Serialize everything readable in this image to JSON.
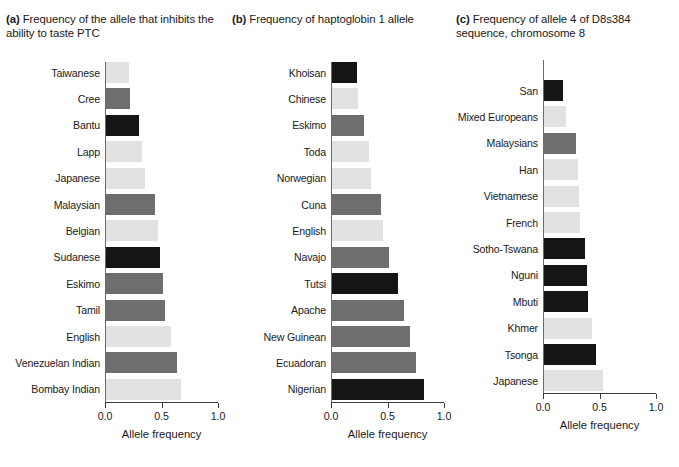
{
  "figure": {
    "axis_title": "Allele frequency",
    "tick_labels": [
      "0.0",
      "0.5",
      "1.0"
    ],
    "tick_values": [
      0.0,
      0.5,
      1.0
    ]
  },
  "panels": [
    {
      "letter": "(a)",
      "title": "Frequency of the allele that inhibits the ability to taste PTC"
    },
    {
      "letter": "(b)",
      "title": "Frequency of haptoglobin 1 allele"
    },
    {
      "letter": "(c)",
      "title": "Frequency of allele 4 of D8s384 sequence, chromosome 8"
    }
  ],
  "chart_data": [
    {
      "type": "bar",
      "title": "Frequency of the allele that inhibits the ability to taste PTC",
      "panel": "(a)",
      "orientation": "horizontal",
      "xlabel": "Allele frequency",
      "ylabel": "",
      "xlim": [
        0.0,
        1.0
      ],
      "xticks": [
        0.0,
        0.5,
        1.0
      ],
      "grid": false,
      "legend": "none",
      "categories": [
        "Taiwanese",
        "Cree",
        "Bantu",
        "Lapp",
        "Japanese",
        "Malaysian",
        "Belgian",
        "Sudanese",
        "Eskimo",
        "Tamil",
        "English",
        "Venezuelan Indian",
        "Bombay Indian"
      ],
      "values": [
        0.21,
        0.22,
        0.3,
        0.33,
        0.35,
        0.44,
        0.47,
        0.49,
        0.51,
        0.53,
        0.58,
        0.64,
        0.67
      ],
      "colors": [
        "#e2e2e2",
        "#6e6e6e",
        "#151515",
        "#e2e2e2",
        "#e2e2e2",
        "#6e6e6e",
        "#e2e2e2",
        "#151515",
        "#6e6e6e",
        "#6e6e6e",
        "#e2e2e2",
        "#6e6e6e",
        "#e2e2e2"
      ]
    },
    {
      "type": "bar",
      "title": "Frequency of haptoglobin 1 allele",
      "panel": "(b)",
      "orientation": "horizontal",
      "xlabel": "Allele frequency",
      "ylabel": "",
      "xlim": [
        0.0,
        1.0
      ],
      "xticks": [
        0.0,
        0.5,
        1.0
      ],
      "grid": false,
      "legend": "none",
      "categories": [
        "Khoisan",
        "Chinese",
        "Eskimo",
        "Toda",
        "Norwegian",
        "Cuna",
        "English",
        "Navajo",
        "Tutsi",
        "Apache",
        "New Guinean",
        "Ecuadoran",
        "Nigerian"
      ],
      "values": [
        0.23,
        0.24,
        0.29,
        0.34,
        0.35,
        0.44,
        0.46,
        0.51,
        0.59,
        0.65,
        0.7,
        0.75,
        0.82
      ],
      "colors": [
        "#151515",
        "#e2e2e2",
        "#6e6e6e",
        "#e2e2e2",
        "#e2e2e2",
        "#6e6e6e",
        "#e2e2e2",
        "#6e6e6e",
        "#151515",
        "#6e6e6e",
        "#6e6e6e",
        "#6e6e6e",
        "#151515"
      ]
    },
    {
      "type": "bar",
      "title": "Frequency of allele 4 of D8s384 sequence, chromosome 8",
      "panel": "(c)",
      "orientation": "horizontal",
      "xlabel": "Allele frequency",
      "ylabel": "",
      "xlim": [
        0.0,
        1.0
      ],
      "xticks": [
        0.0,
        0.5,
        1.0
      ],
      "grid": false,
      "legend": "none",
      "categories": [
        "San",
        "Mixed Europeans",
        "Malaysians",
        "Han",
        "Vietnamese",
        "French",
        "Sotho-Tswana",
        "Nguni",
        "Mbuti",
        "Khmer",
        "Tsonga",
        "Japanese"
      ],
      "values": [
        0.18,
        0.2,
        0.29,
        0.31,
        0.32,
        0.33,
        0.37,
        0.39,
        0.4,
        0.43,
        0.47,
        0.53
      ],
      "colors": [
        "#151515",
        "#e2e2e2",
        "#6e6e6e",
        "#e2e2e2",
        "#e2e2e2",
        "#e2e2e2",
        "#151515",
        "#151515",
        "#151515",
        "#e2e2e2",
        "#151515",
        "#e2e2e2"
      ]
    }
  ]
}
